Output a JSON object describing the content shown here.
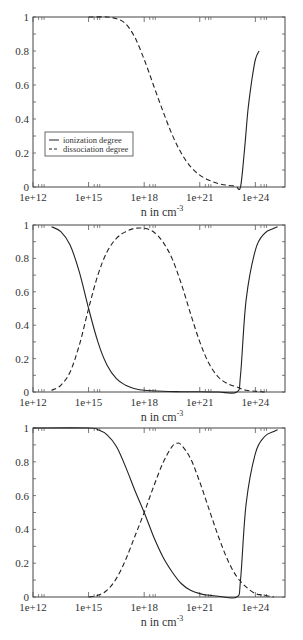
{
  "chart_data": [
    {
      "type": "line",
      "panel": 1,
      "xscale": "log10",
      "xlim_exp": [
        12,
        25.6
      ],
      "ylim": [
        0,
        1
      ],
      "xlabel": "n in  cm",
      "xlabel_sup": "-3",
      "ylabel": "",
      "x_ticks": [
        "1e+12",
        "1e+15",
        "1e+18",
        "1e+21",
        "1e+24"
      ],
      "x_tick_exps": [
        12,
        15,
        18,
        21,
        24
      ],
      "y_ticks": [
        "0",
        "0.2",
        "0.4",
        "0.6",
        "0.8",
        "1"
      ],
      "y_tick_vals": [
        0,
        0.2,
        0.4,
        0.6,
        0.8,
        1
      ],
      "grid": false,
      "legend": {
        "position": "middle-left",
        "entries": [
          "ionization degree",
          "dissociation degree"
        ]
      },
      "series": [
        {
          "name": "ionization degree",
          "style": "solid",
          "x_exp": [
            23.0,
            23.2,
            23.4,
            23.6,
            23.8,
            24.0,
            24.2
          ],
          "values": [
            0.0,
            0.0,
            0.2,
            0.45,
            0.62,
            0.75,
            0.8
          ]
        },
        {
          "name": "dissociation degree",
          "style": "dashed",
          "x_exp": [
            15.0,
            16.0,
            16.5,
            17.0,
            17.5,
            18.0,
            18.5,
            19.0,
            19.5,
            20.0,
            20.5,
            21.0,
            21.5,
            22.0,
            22.5,
            23.0
          ],
          "values": [
            1.0,
            1.0,
            0.99,
            0.96,
            0.88,
            0.75,
            0.6,
            0.45,
            0.31,
            0.2,
            0.12,
            0.07,
            0.04,
            0.02,
            0.01,
            0.005
          ]
        }
      ]
    },
    {
      "type": "line",
      "panel": 2,
      "xscale": "log10",
      "xlim_exp": [
        12,
        25.6
      ],
      "ylim": [
        0,
        1
      ],
      "xlabel": "n in  cm",
      "xlabel_sup": "-3",
      "x_ticks": [
        "1e+12",
        "1e+15",
        "1e+18",
        "1e+21",
        "1e+24"
      ],
      "x_tick_exps": [
        12,
        15,
        18,
        21,
        24
      ],
      "y_ticks": [
        "0",
        "0.2",
        "0.4",
        "0.6",
        "0.8",
        "1"
      ],
      "y_tick_vals": [
        0,
        0.2,
        0.4,
        0.6,
        0.8,
        1
      ],
      "grid": false,
      "series": [
        {
          "name": "ionization degree",
          "style": "solid",
          "x_exp": [
            13.0,
            13.5,
            14.0,
            14.5,
            15.0,
            15.5,
            16.0,
            16.5,
            17.0,
            17.5,
            18.0,
            19.0,
            20.0,
            21.0,
            22.0,
            23.0,
            23.2,
            23.5,
            24.0,
            24.5,
            25.0,
            25.2
          ],
          "values": [
            0.99,
            0.96,
            0.88,
            0.72,
            0.5,
            0.3,
            0.16,
            0.08,
            0.04,
            0.02,
            0.01,
            0.004,
            0.002,
            0.001,
            0.0,
            0.0,
            0.1,
            0.55,
            0.85,
            0.95,
            0.98,
            0.99
          ]
        },
        {
          "name": "dissociation degree",
          "style": "dashed",
          "x_exp": [
            13.0,
            13.5,
            14.0,
            14.5,
            15.0,
            15.5,
            16.0,
            16.5,
            17.0,
            17.5,
            18.0,
            18.5,
            19.0,
            19.5,
            20.0,
            20.5,
            21.0,
            21.5,
            22.0,
            22.5,
            23.0,
            23.5,
            24.0,
            24.5
          ],
          "values": [
            0.01,
            0.04,
            0.12,
            0.28,
            0.5,
            0.7,
            0.84,
            0.92,
            0.96,
            0.98,
            0.98,
            0.96,
            0.9,
            0.8,
            0.65,
            0.47,
            0.3,
            0.17,
            0.09,
            0.05,
            0.03,
            0.01,
            0.005,
            0.0
          ]
        }
      ]
    },
    {
      "type": "line",
      "panel": 3,
      "xscale": "log10",
      "xlim_exp": [
        12,
        25.6
      ],
      "ylim": [
        0,
        1
      ],
      "xlabel": "n in  cm",
      "xlabel_sup": "-3",
      "x_ticks": [
        "1e+12",
        "1e+15",
        "1e+18",
        "1e+21",
        "1e+24"
      ],
      "x_tick_exps": [
        12,
        15,
        18,
        21,
        24
      ],
      "y_ticks": [
        "0",
        "0.2",
        "0.4",
        "0.6",
        "0.8",
        "1"
      ],
      "y_tick_vals": [
        0,
        0.2,
        0.4,
        0.6,
        0.8,
        1
      ],
      "grid": false,
      "series": [
        {
          "name": "ionization degree",
          "style": "solid",
          "x_exp": [
            12.0,
            15.0,
            15.5,
            16.0,
            16.5,
            17.0,
            17.5,
            18.0,
            18.5,
            19.0,
            19.5,
            20.0,
            20.5,
            21.0,
            21.5,
            22.0,
            23.0,
            23.2,
            23.5,
            24.0,
            24.5,
            25.0,
            25.2
          ],
          "values": [
            1.0,
            1.0,
            0.99,
            0.96,
            0.89,
            0.77,
            0.63,
            0.5,
            0.36,
            0.24,
            0.15,
            0.08,
            0.04,
            0.02,
            0.01,
            0.005,
            0.0,
            0.1,
            0.55,
            0.85,
            0.95,
            0.98,
            0.99
          ]
        },
        {
          "name": "dissociation degree",
          "style": "dashed",
          "x_exp": [
            15.0,
            15.5,
            16.0,
            16.5,
            17.0,
            17.5,
            18.0,
            18.5,
            19.0,
            19.5,
            19.8,
            20.0,
            20.5,
            21.0,
            21.5,
            22.0,
            22.5,
            23.0,
            23.5,
            24.0,
            24.5,
            25.0
          ],
          "values": [
            0.0,
            0.01,
            0.04,
            0.11,
            0.22,
            0.36,
            0.5,
            0.65,
            0.79,
            0.89,
            0.91,
            0.9,
            0.82,
            0.68,
            0.52,
            0.36,
            0.22,
            0.12,
            0.06,
            0.02,
            0.01,
            0.0
          ]
        }
      ]
    }
  ],
  "panels": [
    {
      "top": 0
    },
    {
      "top": 208
    },
    {
      "top": 411
    }
  ]
}
